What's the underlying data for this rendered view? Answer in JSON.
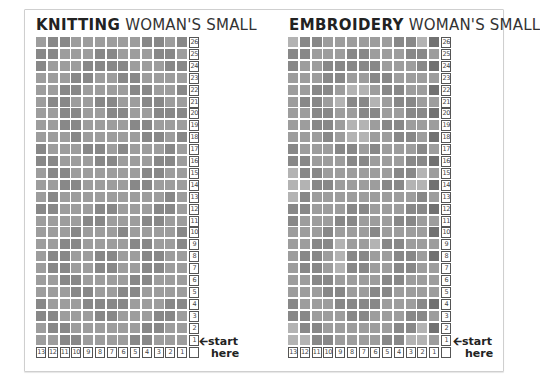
{
  "colors": {
    "frame_border": "#cfcfcf",
    "shade_1": "#b3b3b3",
    "shade_2": "#9d9d9d",
    "shade_3": "#888888",
    "shade_4": "#717171",
    "grid_line": "#ffffff"
  },
  "charts": [
    {
      "title_bold": "KNITTING",
      "title_rest": "WOMAN'S SMALL",
      "rows": 26,
      "cols": 13,
      "row_labels": [
        "26",
        "25",
        "24",
        "23",
        "22",
        "21",
        "20",
        "19",
        "18",
        "17",
        "16",
        "15",
        "14",
        "13",
        "12",
        "11",
        "10",
        "9",
        "8",
        "7",
        "6",
        "5",
        "4",
        "3",
        "2",
        "1"
      ],
      "col_labels": [
        "13",
        "12",
        "11",
        "10",
        "9",
        "8",
        "7",
        "6",
        "5",
        "4",
        "3",
        "2",
        "1"
      ],
      "pattern": [
        [
          2,
          3,
          3,
          2,
          2,
          2,
          2,
          2,
          2,
          3,
          3,
          2,
          3
        ],
        [
          3,
          3,
          2,
          2,
          2,
          3,
          3,
          2,
          2,
          2,
          3,
          3,
          2
        ],
        [
          3,
          2,
          2,
          2,
          3,
          3,
          3,
          3,
          2,
          2,
          2,
          3,
          3
        ],
        [
          2,
          2,
          2,
          3,
          3,
          2,
          2,
          3,
          3,
          2,
          2,
          2,
          2
        ],
        [
          2,
          2,
          3,
          3,
          2,
          2,
          2,
          2,
          3,
          3,
          2,
          2,
          3
        ],
        [
          2,
          3,
          3,
          2,
          2,
          3,
          3,
          2,
          2,
          3,
          3,
          2,
          2
        ],
        [
          2,
          2,
          3,
          3,
          2,
          2,
          3,
          3,
          2,
          2,
          3,
          3,
          3
        ],
        [
          2,
          2,
          3,
          3,
          2,
          2,
          2,
          2,
          3,
          3,
          2,
          2,
          2
        ],
        [
          2,
          2,
          2,
          3,
          2,
          2,
          2,
          2,
          2,
          3,
          3,
          2,
          3
        ],
        [
          3,
          2,
          2,
          2,
          3,
          3,
          2,
          3,
          2,
          2,
          2,
          3,
          2
        ],
        [
          3,
          3,
          2,
          2,
          2,
          3,
          3,
          2,
          2,
          2,
          3,
          3,
          2
        ],
        [
          2,
          3,
          3,
          2,
          2,
          2,
          2,
          2,
          2,
          3,
          3,
          2,
          2
        ],
        [
          2,
          2,
          3,
          3,
          2,
          2,
          2,
          2,
          3,
          3,
          2,
          2,
          2
        ],
        [
          2,
          3,
          2,
          2,
          2,
          2,
          2,
          2,
          2,
          2,
          2,
          3,
          2
        ],
        [
          3,
          3,
          2,
          2,
          2,
          3,
          3,
          2,
          2,
          2,
          3,
          3,
          2
        ],
        [
          2,
          2,
          2,
          2,
          3,
          3,
          2,
          2,
          2,
          3,
          3,
          2,
          2
        ],
        [
          2,
          2,
          2,
          3,
          2,
          2,
          2,
          3,
          2,
          2,
          2,
          2,
          3
        ],
        [
          2,
          2,
          3,
          3,
          2,
          2,
          2,
          2,
          3,
          3,
          2,
          2,
          3
        ],
        [
          2,
          3,
          3,
          2,
          2,
          3,
          3,
          2,
          2,
          3,
          3,
          2,
          2
        ],
        [
          2,
          3,
          3,
          2,
          2,
          3,
          3,
          2,
          2,
          3,
          3,
          2,
          2
        ],
        [
          2,
          2,
          3,
          3,
          2,
          2,
          2,
          2,
          3,
          3,
          2,
          2,
          2
        ],
        [
          2,
          2,
          2,
          3,
          3,
          2,
          2,
          3,
          3,
          2,
          2,
          2,
          2
        ],
        [
          3,
          2,
          2,
          2,
          3,
          3,
          3,
          3,
          2,
          2,
          2,
          3,
          3
        ],
        [
          3,
          3,
          2,
          2,
          2,
          3,
          3,
          2,
          2,
          2,
          3,
          3,
          2
        ],
        [
          2,
          3,
          3,
          2,
          2,
          2,
          2,
          2,
          2,
          3,
          3,
          2,
          2
        ],
        [
          2,
          2,
          3,
          3,
          2,
          2,
          2,
          2,
          3,
          3,
          2,
          2,
          2
        ]
      ],
      "start_label_line1": "start",
      "start_label_line2": "here"
    },
    {
      "title_bold": "EMBROIDERY",
      "title_rest": "WOMAN'S SMALL",
      "rows": 26,
      "cols": 13,
      "row_labels": [
        "26",
        "25",
        "24",
        "23",
        "22",
        "21",
        "20",
        "19",
        "18",
        "17",
        "16",
        "15",
        "14",
        "13",
        "12",
        "11",
        "10",
        "9",
        "8",
        "7",
        "6",
        "5",
        "4",
        "3",
        "2",
        "1"
      ],
      "col_labels": [
        "13",
        "12",
        "11",
        "10",
        "9",
        "8",
        "7",
        "6",
        "5",
        "4",
        "3",
        "2",
        "1"
      ],
      "pattern": [
        [
          1,
          3,
          3,
          2,
          2,
          2,
          2,
          2,
          2,
          3,
          3,
          1,
          4
        ],
        [
          3,
          3,
          2,
          2,
          2,
          3,
          3,
          2,
          2,
          2,
          3,
          3,
          2
        ],
        [
          3,
          2,
          2,
          3,
          3,
          3,
          3,
          3,
          2,
          2,
          2,
          3,
          4
        ],
        [
          2,
          2,
          2,
          3,
          3,
          2,
          2,
          3,
          3,
          2,
          2,
          2,
          2
        ],
        [
          2,
          2,
          3,
          3,
          2,
          1,
          1,
          2,
          3,
          3,
          2,
          2,
          4
        ],
        [
          2,
          3,
          3,
          2,
          1,
          3,
          3,
          1,
          2,
          3,
          3,
          2,
          2
        ],
        [
          2,
          2,
          3,
          3,
          2,
          2,
          3,
          3,
          2,
          2,
          3,
          3,
          4
        ],
        [
          2,
          2,
          3,
          3,
          2,
          1,
          1,
          2,
          3,
          3,
          2,
          2,
          2
        ],
        [
          2,
          2,
          2,
          3,
          2,
          1,
          1,
          2,
          2,
          3,
          3,
          2,
          4
        ],
        [
          3,
          2,
          2,
          2,
          3,
          3,
          2,
          3,
          2,
          2,
          2,
          3,
          2
        ],
        [
          3,
          3,
          2,
          2,
          2,
          3,
          3,
          2,
          2,
          2,
          3,
          3,
          4
        ],
        [
          1,
          3,
          3,
          2,
          2,
          2,
          2,
          2,
          2,
          3,
          3,
          1,
          2
        ],
        [
          1,
          1,
          3,
          3,
          2,
          2,
          2,
          2,
          3,
          3,
          1,
          1,
          4
        ],
        [
          1,
          3,
          2,
          2,
          2,
          2,
          2,
          2,
          2,
          2,
          2,
          3,
          2
        ],
        [
          3,
          3,
          2,
          2,
          2,
          3,
          3,
          2,
          2,
          2,
          3,
          3,
          4
        ],
        [
          3,
          2,
          2,
          2,
          3,
          3,
          2,
          2,
          2,
          3,
          3,
          2,
          2
        ],
        [
          2,
          2,
          2,
          3,
          2,
          2,
          2,
          3,
          2,
          2,
          2,
          2,
          4
        ],
        [
          2,
          2,
          3,
          3,
          1,
          2,
          2,
          1,
          3,
          3,
          2,
          2,
          2
        ],
        [
          2,
          3,
          3,
          2,
          1,
          3,
          3,
          2,
          2,
          3,
          3,
          2,
          4
        ],
        [
          2,
          3,
          3,
          2,
          1,
          3,
          3,
          2,
          2,
          3,
          3,
          2,
          2
        ],
        [
          2,
          2,
          3,
          3,
          2,
          2,
          2,
          2,
          3,
          3,
          2,
          2,
          2
        ],
        [
          2,
          2,
          2,
          3,
          3,
          2,
          2,
          3,
          3,
          2,
          2,
          2,
          2
        ],
        [
          3,
          2,
          2,
          2,
          3,
          3,
          3,
          3,
          2,
          2,
          2,
          3,
          4
        ],
        [
          3,
          3,
          2,
          2,
          2,
          3,
          3,
          2,
          2,
          2,
          3,
          3,
          2
        ],
        [
          1,
          3,
          3,
          2,
          2,
          2,
          2,
          2,
          2,
          3,
          3,
          1,
          4
        ],
        [
          1,
          1,
          3,
          3,
          2,
          2,
          2,
          2,
          3,
          3,
          1,
          1,
          2
        ]
      ],
      "start_label_line1": "start",
      "start_label_line2": "here"
    }
  ]
}
